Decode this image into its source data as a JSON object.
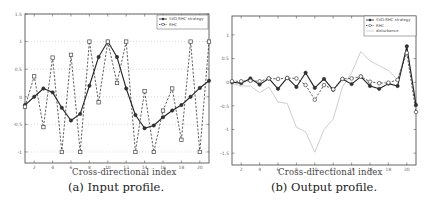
{
  "chart_data": [
    {
      "type": "line",
      "panel": "a",
      "caption": "(a) Input profile.",
      "title": "",
      "xlabel": "Cross-directional index",
      "ylabel": "",
      "x": [
        1,
        2,
        3,
        4,
        5,
        6,
        7,
        8,
        9,
        10,
        11,
        12,
        13,
        14,
        15,
        16,
        17,
        18,
        19,
        20,
        21
      ],
      "xticks": [
        2,
        4,
        6,
        8,
        10,
        12,
        14,
        16,
        18,
        20
      ],
      "yticks": [
        1.5,
        1,
        0.5,
        0,
        -0.5,
        -1
      ],
      "ytick_labels": [
        "1.5",
        "1",
        "0.5",
        "0",
        "-0.5",
        "-1"
      ],
      "xlim": [
        1,
        21
      ],
      "ylim": [
        -1.2,
        1.5
      ],
      "grid": "horizontal dotted",
      "legend_position": "upper right",
      "series": [
        {
          "name": "SVD-RHC strategy",
          "style": "solid",
          "marker": "filled-circle",
          "values": [
            -0.15,
            0,
            0.15,
            0.08,
            -0.2,
            -0.43,
            -0.31,
            0.2,
            0.72,
            1.0,
            0.72,
            0.15,
            -0.33,
            -0.57,
            -0.52,
            -0.37,
            -0.25,
            -0.15,
            0,
            0.16,
            0.29
          ]
        },
        {
          "name": "RHC",
          "style": "dashed",
          "marker": "open-square",
          "values": [
            -0.18,
            0.37,
            -0.55,
            0.71,
            -1.0,
            0.76,
            -1.0,
            1.0,
            -0.1,
            1.0,
            0.25,
            1.0,
            -1.0,
            0.1,
            -1.0,
            -0.25,
            0.15,
            -0.78,
            1.0,
            -1.0,
            1.0
          ]
        }
      ]
    },
    {
      "type": "line",
      "panel": "b",
      "caption": "(b) Output profile.",
      "title": "",
      "xlabel": "Cross-directional index",
      "ylabel": "",
      "x": [
        1,
        2,
        3,
        4,
        5,
        6,
        7,
        8,
        9,
        10,
        11,
        12,
        13,
        14,
        15,
        16,
        17,
        18,
        19,
        20,
        21
      ],
      "xticks": [
        2,
        4,
        6,
        8,
        10,
        12,
        14,
        16,
        18,
        20
      ],
      "yticks": [
        1,
        0.5,
        0,
        -0.5,
        -1,
        -1.5
      ],
      "ytick_labels": [
        "1",
        "0.5",
        "0",
        "-0.5",
        "-1",
        "-1.5"
      ],
      "xlim": [
        1,
        21
      ],
      "ylim": [
        -1.75,
        1.4
      ],
      "grid": "none",
      "legend_position": "upper right",
      "series": [
        {
          "name": "SVD-RHC strategy",
          "style": "solid",
          "marker": "filled-circle",
          "values": [
            0,
            -0.02,
            0.08,
            -0.05,
            0.08,
            -0.14,
            0.09,
            -0.1,
            0.2,
            -0.12,
            0.07,
            -0.16,
            0.07,
            -0.04,
            0.12,
            -0.08,
            -0.14,
            -0.03,
            -0.08,
            0.76,
            -0.48
          ]
        },
        {
          "name": "RHC",
          "style": "dashed",
          "marker": "open-circle",
          "values": [
            0.02,
            0.02,
            0.03,
            0.02,
            0.08,
            0.07,
            0.09,
            0.08,
            -0.06,
            -0.37,
            -0.06,
            -0.15,
            0.07,
            0.08,
            0.12,
            0.01,
            -0.02,
            -0.01,
            0.05,
            0.62,
            -0.63
          ]
        },
        {
          "name": "disturbance",
          "style": "solid-light",
          "marker": "none",
          "values": [
            -0.03,
            -0.08,
            -0.08,
            -0.22,
            -0.1,
            -0.42,
            -0.45,
            -0.95,
            -1.05,
            -1.48,
            -1.0,
            -0.78,
            -0.1,
            0.2,
            0.65,
            0.45,
            0.35,
            0.25,
            0.05,
            0.73,
            -0.55
          ]
        }
      ]
    }
  ],
  "captions": {
    "a": "(a) Input profile.",
    "b": "(b) Output profile."
  },
  "xlabels": {
    "a": "Cross-directional index",
    "b": "Cross-directional index"
  },
  "colors": {
    "svd": "#222222",
    "rhc": "#333333",
    "disturbance": "#c8c8c8",
    "axis": "#555555",
    "grid": "#bbbbbb"
  }
}
